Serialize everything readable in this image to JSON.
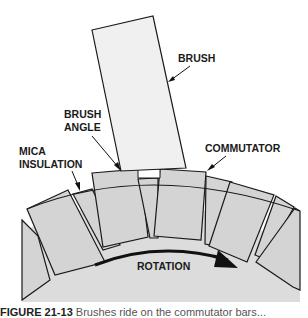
{
  "labels": {
    "brush": "BRUSH",
    "brush_angle_line1": "BRUSH",
    "brush_angle_line2": "ANGLE",
    "mica_line1": "MICA",
    "mica_line2": "INSULATION",
    "commutator": "COMMUTATOR",
    "rotation": "ROTATION"
  },
  "caption": {
    "figure_number": "FIGURE 21-13",
    "text": "Brushes ride on the commutator bars..."
  },
  "colors": {
    "segment_fill": "#d4d4d4",
    "hub_fill": "#dcdcdc",
    "brush_fill": "#f0f0f0",
    "outline": "#1a1a1a"
  }
}
